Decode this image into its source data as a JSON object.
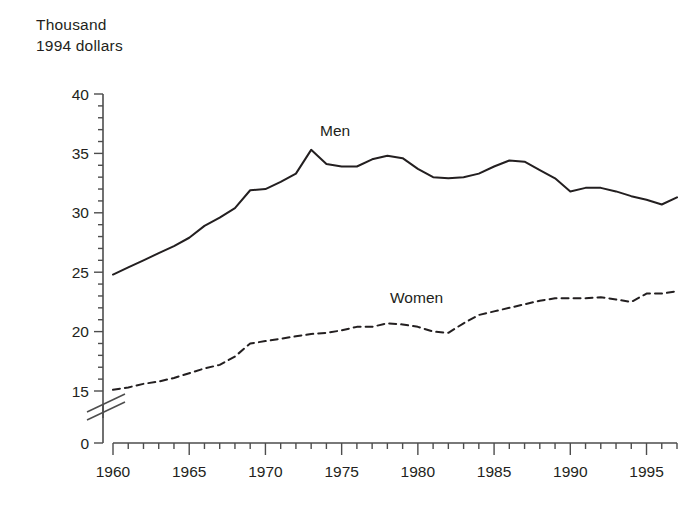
{
  "chart_data": {
    "type": "line",
    "title": "",
    "ylabel_line1": "Thousand",
    "ylabel_line2": "1994 dollars",
    "xlabel": "",
    "ylabel": "Thousand 1994 dollars",
    "xlim": [
      1960,
      1997
    ],
    "ylim": [
      0,
      40
    ],
    "y_axis_break": {
      "from": 0,
      "to": 15,
      "present": true
    },
    "y_ticks_major": [
      0,
      15,
      20,
      25,
      30,
      35,
      40
    ],
    "y_tick_labels": [
      "0",
      "15",
      "20",
      "25",
      "30",
      "35",
      "40"
    ],
    "y_ticks_minor_step": 1,
    "x_ticks_major": [
      1960,
      1965,
      1970,
      1975,
      1980,
      1985,
      1990,
      1995
    ],
    "x_tick_labels": [
      "1960",
      "1965",
      "1970",
      "1975",
      "1980",
      "1985",
      "1990",
      "1995"
    ],
    "x_ticks_minor_step": 1,
    "grid": false,
    "legend_position": "inline-annotation",
    "x": [
      1960,
      1961,
      1962,
      1963,
      1964,
      1965,
      1966,
      1967,
      1968,
      1969,
      1970,
      1971,
      1972,
      1973,
      1974,
      1975,
      1976,
      1977,
      1978,
      1979,
      1980,
      1981,
      1982,
      1983,
      1984,
      1985,
      1986,
      1987,
      1988,
      1989,
      1990,
      1991,
      1992,
      1993,
      1994,
      1995,
      1996,
      1997
    ],
    "series": [
      {
        "name": "Men",
        "style": "solid",
        "color": "#231f20",
        "label_text": "Men",
        "values": [
          24.8,
          25.4,
          26.0,
          26.6,
          27.2,
          27.9,
          28.9,
          29.6,
          30.4,
          31.9,
          32.0,
          32.6,
          33.3,
          35.3,
          34.1,
          33.9,
          33.9,
          34.5,
          34.8,
          34.6,
          33.7,
          33.0,
          32.9,
          33.0,
          33.3,
          33.9,
          34.4,
          34.3,
          33.6,
          32.9,
          31.8,
          32.1,
          32.1,
          31.8,
          31.4,
          31.1,
          30.7,
          31.3
        ]
      },
      {
        "name": "Women",
        "style": "dashed",
        "color": "#231f20",
        "label_text": "Women",
        "values": [
          15.1,
          15.3,
          15.6,
          15.8,
          16.1,
          16.5,
          16.9,
          17.2,
          17.9,
          19.0,
          19.2,
          19.4,
          19.6,
          19.8,
          19.9,
          20.1,
          20.4,
          20.4,
          20.7,
          20.6,
          20.4,
          20.0,
          19.9,
          20.7,
          21.4,
          21.7,
          22.0,
          22.3,
          22.6,
          22.8,
          22.8,
          22.8,
          22.9,
          22.7,
          22.5,
          23.2,
          23.2,
          23.4
        ]
      }
    ],
    "annotations": [
      {
        "text": "Men",
        "x_px": 320,
        "y_px": 136
      },
      {
        "text": "Women",
        "x_px": 390,
        "y_px": 303
      }
    ]
  },
  "meta": {
    "series_label_men": "Men",
    "series_label_women": "Women"
  }
}
